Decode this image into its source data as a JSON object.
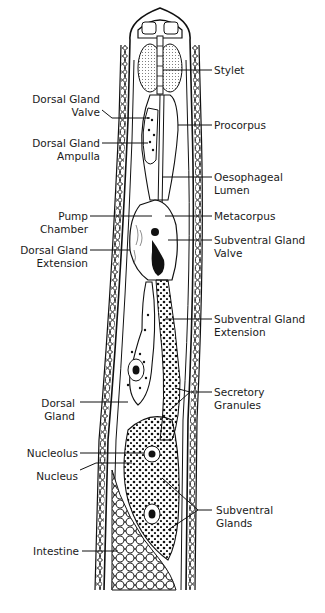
{
  "figure": {
    "labels_right": [
      {
        "id": "stylet",
        "lines": [
          "Stylet"
        ]
      },
      {
        "id": "procorpus",
        "lines": [
          "Procorpus"
        ]
      },
      {
        "id": "oesophageal-lumen",
        "lines": [
          "Oesophageal",
          "Lumen"
        ]
      },
      {
        "id": "metacorpus",
        "lines": [
          "Metacorpus"
        ]
      },
      {
        "id": "subventral-gland-valve",
        "lines": [
          "Subventral Gland",
          "Valve"
        ]
      },
      {
        "id": "subventral-gland-extension",
        "lines": [
          "Subventral Gland",
          "Extension"
        ]
      },
      {
        "id": "secretory-granules",
        "lines": [
          "Secretory",
          "Granules"
        ]
      },
      {
        "id": "subventral-glands",
        "lines": [
          "Subventral",
          "Glands"
        ]
      }
    ],
    "labels_left": [
      {
        "id": "dorsal-gland-valve",
        "lines": [
          "Dorsal Gland",
          "Valve"
        ]
      },
      {
        "id": "dorsal-gland-ampulla",
        "lines": [
          "Dorsal Gland",
          "Ampulla"
        ]
      },
      {
        "id": "pump-chamber",
        "lines": [
          "Pump",
          "Chamber"
        ]
      },
      {
        "id": "dorsal-gland-extension",
        "lines": [
          "Dorsal Gland",
          "Extension"
        ]
      },
      {
        "id": "dorsal-gland",
        "lines": [
          "Dorsal",
          "Gland"
        ]
      },
      {
        "id": "nucleolus",
        "lines": [
          "Nucleolus"
        ]
      },
      {
        "id": "nucleus",
        "lines": [
          "Nucleus"
        ]
      },
      {
        "id": "intestine",
        "lines": [
          "Intestine"
        ]
      }
    ]
  }
}
